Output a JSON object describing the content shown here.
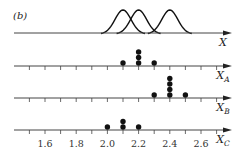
{
  "figure": {
    "panel_label": "(b)",
    "axis_color": "#444444",
    "ink_color": "#111111"
  },
  "chart_data": {
    "type": "scatter",
    "title": "",
    "xlabel": "",
    "ylabel": "",
    "xlim": [
      1.5,
      2.7
    ],
    "tick_step": 0.1,
    "tick_labels": [
      "1.6",
      "1.8",
      "2.0",
      "2.2",
      "2.4",
      "2.6"
    ],
    "tick_label_values": [
      1.6,
      1.8,
      2.0,
      2.2,
      2.4,
      2.6
    ],
    "grid": false,
    "distributions": {
      "axis_label": "X",
      "curve_peaks": [
        2.1,
        2.2,
        2.4
      ],
      "description": "three identical bell-shaped curves"
    },
    "series": [
      {
        "name": "X_A",
        "axis_label": "X",
        "subscript": "A",
        "values": [
          2.1,
          2.2,
          2.2,
          2.2,
          2.3
        ]
      },
      {
        "name": "X_B",
        "axis_label": "X",
        "subscript": "B",
        "values": [
          2.3,
          2.4,
          2.4,
          2.4,
          2.4,
          2.5
        ]
      },
      {
        "name": "X_C",
        "axis_label": "X",
        "subscript": "C",
        "values": [
          2.0,
          2.1,
          2.1,
          2.2
        ]
      }
    ]
  }
}
